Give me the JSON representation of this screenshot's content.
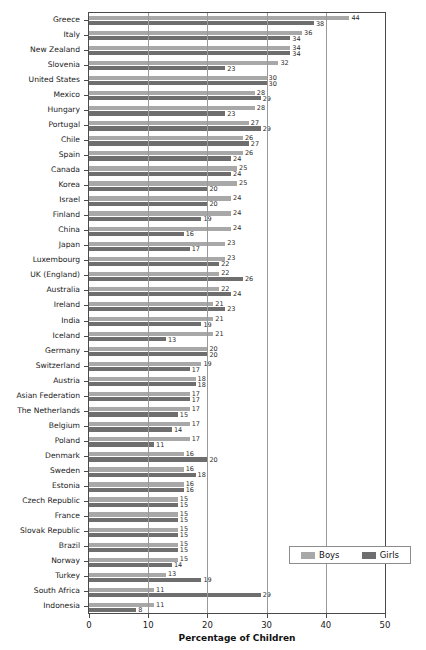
{
  "caption_fragment": "",
  "chart_data": {
    "type": "bar",
    "orientation": "horizontal",
    "title": "",
    "xlabel": "Percentage of Children",
    "ylabel": "",
    "xlim": [
      0,
      50
    ],
    "xticks": [
      0,
      10,
      20,
      30,
      40,
      50
    ],
    "grid": true,
    "legend_position": "bottom-right",
    "categories": [
      "Greece",
      "Italy",
      "New Zealand",
      "Slovenia",
      "United States",
      "Mexico",
      "Hungary",
      "Portugal",
      "Chile",
      "Spain",
      "Canada",
      "Korea",
      "Israel",
      "Finland",
      "China",
      "Japan",
      "Luxembourg",
      "UK (England)",
      "Australia",
      "Ireland",
      "India",
      "Iceland",
      "Germany",
      "Switzerland",
      "Austria",
      "Asian Federation",
      "The Netherlands",
      "Belgium",
      "Poland",
      "Denmark",
      "Sweden",
      "Estonia",
      "Czech Republic",
      "France",
      "Slovak Republic",
      "Brazil",
      "Norway",
      "Turkey",
      "South Africa",
      "Indonesia"
    ],
    "series": [
      {
        "name": "Boys",
        "color": "#a8a8a8",
        "values": [
          44,
          36,
          34,
          32,
          30,
          28,
          28,
          27,
          26,
          26,
          25,
          25,
          24,
          24,
          24,
          23,
          23,
          22,
          22,
          21,
          21,
          21,
          20,
          19,
          18,
          17,
          17,
          17,
          17,
          16,
          16,
          16,
          15,
          15,
          15,
          15,
          15,
          13,
          11,
          11
        ]
      },
      {
        "name": "Girls",
        "color": "#6e6e6e",
        "values": [
          38,
          34,
          34,
          23,
          30,
          29,
          23,
          29,
          27,
          24,
          24,
          20,
          20,
          19,
          16,
          17,
          22,
          26,
          24,
          23,
          19,
          13,
          20,
          17,
          18,
          17,
          15,
          14,
          11,
          20,
          18,
          16,
          15,
          15,
          15,
          15,
          14,
          19,
          29,
          8
        ]
      }
    ]
  },
  "legend": {
    "boys_label": "Boys",
    "girls_label": "Girls"
  },
  "colors": {
    "boys": "#a8a8a8",
    "girls": "#6e6e6e",
    "axis": "#4a4a4a",
    "grid": "#9a9a9a"
  }
}
